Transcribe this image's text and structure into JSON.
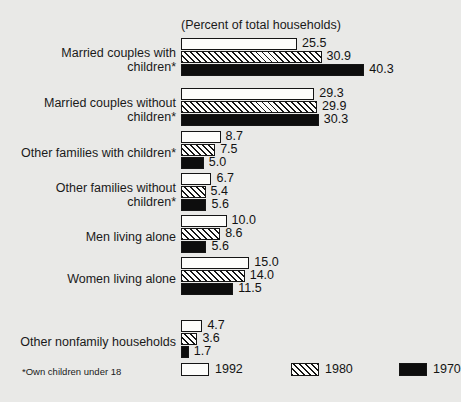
{
  "chart_data": {
    "type": "bar",
    "orientation": "horizontal",
    "title": "(Percent of total households)",
    "xlabel": "",
    "ylabel": "",
    "xlim": [
      0,
      40.3
    ],
    "grid": false,
    "legend_position": "bottom-right",
    "footnote": "*Own children under 18",
    "categories": [
      "Married couples with\nchildren*",
      "Married couples without\nchildren*",
      "Other families with children*",
      "Other families without\nchildren*",
      "Men living alone",
      "Women living alone",
      "Other nonfamily households"
    ],
    "series": [
      {
        "name": "1992",
        "fill": "white",
        "color": "#fdfdfb",
        "values": [
          25.5,
          29.3,
          8.7,
          6.7,
          10.0,
          15.0,
          4.7
        ],
        "labels": [
          "25.5",
          "29.3",
          "8.7",
          "6.7",
          "10.0",
          "15.0",
          "4.7"
        ]
      },
      {
        "name": "1980",
        "fill": "hatched",
        "color": "#fdfdfb",
        "values": [
          30.9,
          29.9,
          7.5,
          5.4,
          8.6,
          14.0,
          3.6
        ],
        "labels": [
          "30.9",
          "29.9",
          "7.5",
          "5.4",
          "8.6",
          "14.0",
          "3.6"
        ]
      },
      {
        "name": "1970",
        "fill": "solid",
        "color": "#0d0d0d",
        "values": [
          40.3,
          30.3,
          5.0,
          5.6,
          5.6,
          11.5,
          1.7
        ],
        "labels": [
          "40.3",
          "30.3",
          "5.0",
          "5.6",
          "5.6",
          "11.5",
          "1.7"
        ]
      }
    ]
  },
  "legend": {
    "items": [
      {
        "label": "1992",
        "swatch": "white-swatch-icon"
      },
      {
        "label": "1980",
        "swatch": "hatched-swatch-icon"
      },
      {
        "label": "1970",
        "swatch": "black-swatch-icon"
      }
    ]
  }
}
